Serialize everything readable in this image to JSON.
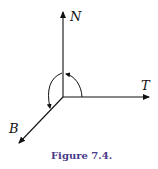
{
  "axes": {
    "normal": {
      "label": "N"
    },
    "tangent": {
      "label": "T"
    },
    "binormal": {
      "label": "B"
    }
  },
  "caption": "Figure 7.4.",
  "colors": {
    "lines": "#111111",
    "caption": "#4a3a8a"
  }
}
